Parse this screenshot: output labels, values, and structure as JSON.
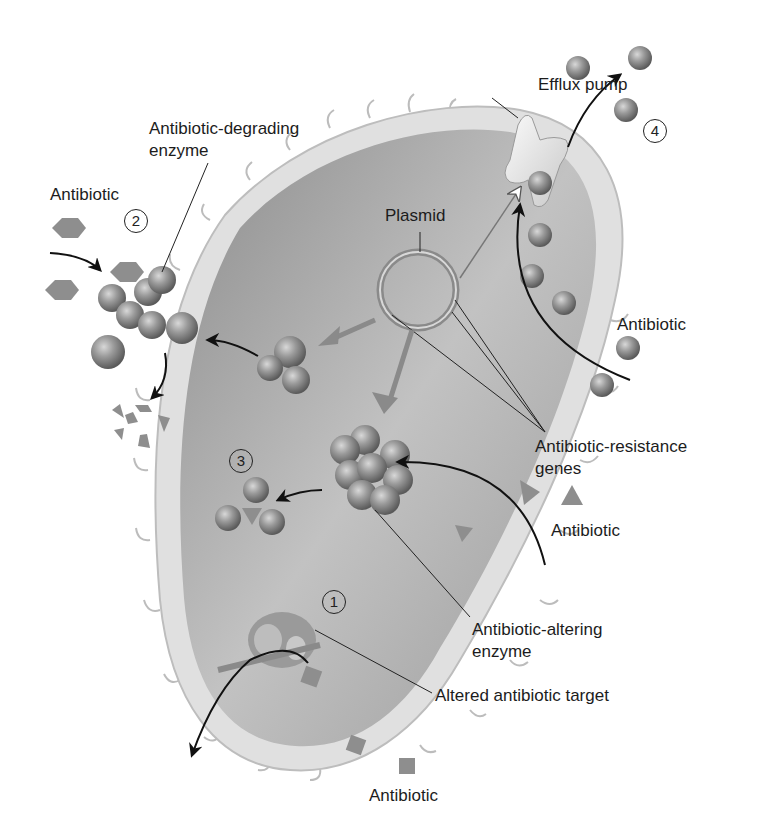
{
  "diagram": {
    "colors": {
      "background": "#ffffff",
      "cytoplasm": "#9a9a9a",
      "cell_wall": "#dedede",
      "molecule": "#8a8a8a",
      "label_text": "#1c1c1c"
    },
    "labels": {
      "efflux_pump": "Efflux pump",
      "degrading_enzyme_line1": "Antibiotic-degrading",
      "degrading_enzyme_line2": "enzyme",
      "antibiotic_hexagon": "Antibiotic",
      "plasmid": "Plasmid",
      "antibiotic_sphere": "Antibiotic",
      "resistance_genes_line1": "Antibiotic-resistance",
      "resistance_genes_line2": "genes",
      "antibiotic_triangle": "Antibiotic",
      "altering_enzyme_line1": "Antibiotic-altering",
      "altering_enzyme_line2": "enzyme",
      "altered_target": "Altered antibiotic target",
      "antibiotic_square": "Antibiotic"
    },
    "mechanism_numbers": {
      "one": "1",
      "two": "2",
      "three": "3",
      "four": "4"
    }
  }
}
